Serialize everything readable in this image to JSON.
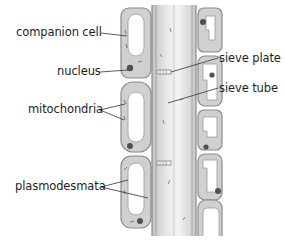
{
  "figure": {
    "colors": {
      "cell_wall": "#8c8c8c",
      "cytoplasm": "#d2d2d2",
      "vacuole": "#ffffff",
      "organelle": "#555555",
      "leader_line": "#333333",
      "label_text": "#1e1e1e"
    }
  },
  "labels": {
    "left": [
      {
        "id": "companion_cell",
        "text": "companion cell"
      },
      {
        "id": "nucleus",
        "text": "nucleus"
      },
      {
        "id": "mitochondria",
        "text": "mitochondria"
      },
      {
        "id": "plasmodesmata",
        "text": "plasmodesmata"
      }
    ],
    "right": [
      {
        "id": "sieve_plate",
        "text": "sieve plate"
      },
      {
        "id": "sieve_tube",
        "text": "sieve tube"
      }
    ]
  }
}
